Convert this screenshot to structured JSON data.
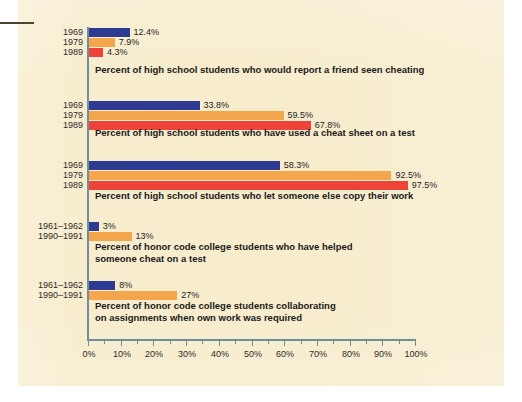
{
  "chart_data": {
    "type": "bar",
    "title": "",
    "subtitle": "",
    "xlabel": "",
    "ylabel": "",
    "xlim": [
      0,
      100
    ],
    "grid": false,
    "orientation": "horizontal",
    "legend": "none",
    "axis": {
      "ticks": [
        0,
        10,
        20,
        30,
        40,
        50,
        60,
        70,
        80,
        90,
        100
      ],
      "tick_labels": [
        "0%",
        "10%",
        "20%",
        "30%",
        "40%",
        "50%",
        "60%",
        "70%",
        "80%",
        "90%",
        "100%"
      ],
      "minor_tick_step": 5
    },
    "colors": {
      "series_1969": "#2e3b93",
      "series_1979": "#f3a64b",
      "series_1989": "#ee4338",
      "series_1961_1962": "#2e3b93",
      "series_1990_1991": "#f3a64b",
      "background": "#f7eccc",
      "axis": "#6f8f9a"
    },
    "groups": [
      {
        "caption": "Percent of high school students who would report a friend seen cheating",
        "caption_lines": [
          "Percent of high school students who would report a friend seen cheating"
        ],
        "bars": [
          {
            "category": "1969",
            "value": 12.4,
            "label": "12.4%",
            "series": "s1969"
          },
          {
            "category": "1979",
            "value": 7.9,
            "label": "7.9%",
            "series": "s1979"
          },
          {
            "category": "1989",
            "value": 4.3,
            "label": "4.3%",
            "series": "s1989"
          }
        ]
      },
      {
        "caption": "Percent of high school students who have used a cheat sheet on a test",
        "caption_lines": [
          "Percent of high school students who have used a cheat sheet on a test"
        ],
        "bars": [
          {
            "category": "1969",
            "value": 33.8,
            "label": "33.8%",
            "series": "s1969"
          },
          {
            "category": "1979",
            "value": 59.5,
            "label": "59.5%",
            "series": "s1979"
          },
          {
            "category": "1989",
            "value": 67.8,
            "label": "67.8%",
            "series": "s1989"
          }
        ]
      },
      {
        "caption": "Percent of high school students who let someone else copy their work",
        "caption_lines": [
          "Percent of high school students who let someone else copy their work"
        ],
        "bars": [
          {
            "category": "1969",
            "value": 58.3,
            "label": "58.3%",
            "series": "s1969"
          },
          {
            "category": "1979",
            "value": 92.5,
            "label": "92.5%",
            "series": "s1979"
          },
          {
            "category": "1989",
            "value": 97.5,
            "label": "97.5%",
            "series": "s1989"
          }
        ]
      },
      {
        "caption": "Percent of honor code college students who have helped someone cheat on a test",
        "caption_lines": [
          "Percent of honor code college students who have helped",
          "someone cheat on a test"
        ],
        "bars": [
          {
            "category": "1961–1962",
            "value": 3,
            "label": "3%",
            "series": "s1969"
          },
          {
            "category": "1990–1991",
            "value": 13,
            "label": "13%",
            "series": "s1979"
          }
        ]
      },
      {
        "caption": "Percent of honor code college students collaborating on assignments when own work was required",
        "caption_lines": [
          "Percent of honor code college students collaborating",
          "on assignments when own work was required"
        ],
        "bars": [
          {
            "category": "1961–1962",
            "value": 8,
            "label": "8%",
            "series": "s1969"
          },
          {
            "category": "1990–1991",
            "value": 27,
            "label": "27%",
            "series": "s1979"
          }
        ]
      }
    ]
  }
}
